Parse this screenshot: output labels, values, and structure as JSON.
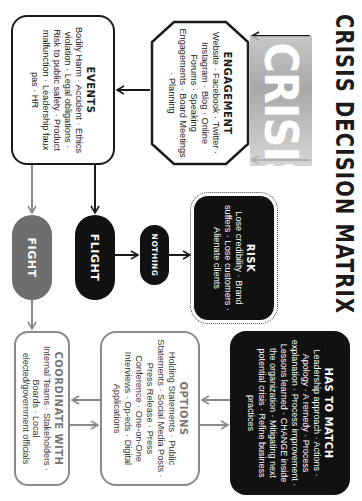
{
  "title": "CRISIS DECISION MATRIX",
  "graphic": {
    "text": "CRISIS"
  },
  "nodes": {
    "engagement": {
      "heading": "ENGAGEMENT",
      "body": "Website · Facebook · Twitter · Instagram · Blog · Online Forums · Speaking Engagements · Board Meetings · Planning"
    },
    "events": {
      "heading": "EVENTS",
      "body": "Bodily Harm · Accident · Ethics violation · Legal obligations · Risk to public safety · Product malfunction · Leadership faux pas · HR"
    },
    "risk": {
      "heading": "RISK",
      "body": "Lose credibility · Brand suffers · Lose customers · Alienate clients"
    },
    "nothing": {
      "label": "NOTHING"
    },
    "flight": {
      "label": "FLIGHT"
    },
    "fight": {
      "label": "FIGHT"
    },
    "has_to_match": {
      "heading": "HAS TO MATCH",
      "body": "Leadership approach · Actions · Apology · A remedy · Process explanation · Process improvement · Lessons learned · CHANGE inside the organization · Mitigating next potential crisis · Refine business practices"
    },
    "options": {
      "heading": "OPTIONS",
      "body": "Holding Statements · Public Statements · Social Media Posts · Press Release · Press Conference · One-on-One Interviews · Op-eds · Digital Applications"
    },
    "coordinate_with": {
      "heading": "COORDINATE WITH",
      "body": "Internal Teams · Stakeholders · Boards · Local elected/government officials"
    }
  },
  "colors": {
    "dark": "#111111",
    "fight_gray": "#6e6e6e",
    "outline_gray": "#8a8a8a",
    "background": "#ffffff"
  }
}
